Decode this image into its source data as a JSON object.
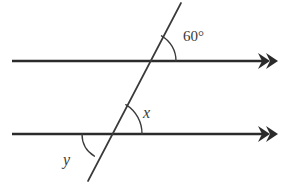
{
  "figure": {
    "background_color": "#ffffff",
    "line_color": "#2b2b2b",
    "transversal_color": "#3a3a3a",
    "width": 286,
    "height": 185
  },
  "labels": {
    "top_angle": "60°",
    "interior_angle": "x",
    "exterior_angle": "y"
  },
  "geometry": {
    "upper_parallel_line": {
      "name": "upper-parallel-line",
      "x1": 12,
      "y1": 61,
      "x2": 268,
      "y2": 61,
      "arrow_marks": 2,
      "arrow_direction": "right"
    },
    "lower_parallel_line": {
      "name": "lower-parallel-line",
      "x1": 12,
      "y1": 134,
      "x2": 268,
      "y2": 134,
      "arrow_marks": 2,
      "arrow_direction": "right"
    },
    "transversal": {
      "name": "transversal-line",
      "x1": 88,
      "y1": 181,
      "x2": 181,
      "y2": 3
    },
    "intersections": {
      "upper": {
        "x": 147,
        "y": 61
      },
      "lower": {
        "x": 108,
        "y": 134
      }
    },
    "arcs": [
      {
        "name": "arc-60",
        "center_x": 147,
        "center_y": 61,
        "radius": 29
      },
      {
        "name": "arc-x",
        "center_x": 108,
        "center_y": 134,
        "radius": 34
      },
      {
        "name": "arc-y",
        "center_x": 108,
        "center_y": 134,
        "radius": 26
      }
    ],
    "label_positions": {
      "top_angle": {
        "x": 183,
        "y": 41
      },
      "interior_angle": {
        "x": 143,
        "y": 118
      },
      "exterior_angle": {
        "x": 64,
        "y": 164
      }
    }
  }
}
